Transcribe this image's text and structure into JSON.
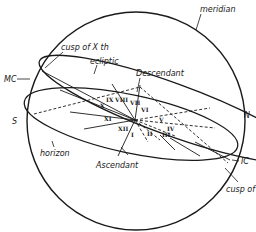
{
  "diagram": {
    "type": "celestial-sphere-houses",
    "labels": {
      "meridian": "meridian",
      "cusp_x": "cusp of Ⅹ th",
      "ecliptic": "ecliptic",
      "mc": "MC",
      "descendant": "Descendant",
      "south": "S",
      "north": "N",
      "horizon": "horizon",
      "ascendant": "Ascendant",
      "ic": "IC",
      "cusp_iv": "cusp of"
    },
    "houses": [
      "I",
      "II",
      "III",
      "IV",
      "V",
      "VI",
      "VII",
      "VIII",
      "IX",
      "X",
      "XI",
      "XII"
    ],
    "colors": {
      "ink": "#1a1a1a",
      "background": "#ffffff"
    }
  }
}
